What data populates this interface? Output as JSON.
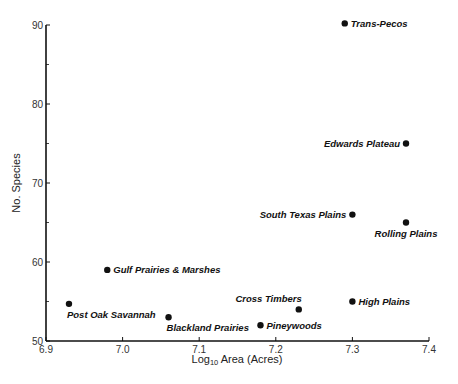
{
  "chart_data": {
    "type": "scatter",
    "title": "",
    "xlabel": "Log10 Area (Acres)",
    "ylabel": "No. Species",
    "xlim": [
      6.9,
      7.4
    ],
    "ylim": [
      50,
      90
    ],
    "x_ticks": [
      "6.9",
      "7.0",
      "7.1",
      "7.2",
      "7.3",
      "7.4"
    ],
    "y_ticks": [
      "50",
      "60",
      "70",
      "80",
      "90"
    ],
    "grid": false,
    "legend": null,
    "points": [
      {
        "label": "Trans-Pecos",
        "x": 7.29,
        "y": 90.2,
        "label_pos": "right"
      },
      {
        "label": "Edwards Plateau",
        "x": 7.37,
        "y": 75,
        "label_pos": "left"
      },
      {
        "label": "South Texas Plains",
        "x": 7.3,
        "y": 66,
        "label_pos": "left"
      },
      {
        "label": "Rolling Plains",
        "x": 7.37,
        "y": 65,
        "label_pos": "below"
      },
      {
        "label": "Gulf Prairies & Marshes",
        "x": 6.98,
        "y": 59,
        "label_pos": "right"
      },
      {
        "label": "Post Oak Savannah",
        "x": 6.93,
        "y": 54.7,
        "label_pos": "below"
      },
      {
        "label": "Cross Timbers",
        "x": 7.23,
        "y": 54,
        "label_pos": "above-left"
      },
      {
        "label": "High Plains",
        "x": 7.3,
        "y": 55,
        "label_pos": "right"
      },
      {
        "label": "Blackland Prairies",
        "x": 7.06,
        "y": 53,
        "label_pos": "below"
      },
      {
        "label": "Pineywoods",
        "x": 7.18,
        "y": 52,
        "label_pos": "right"
      }
    ]
  },
  "axes": {
    "x_title_main": "Log",
    "x_title_sub": "10",
    "x_title_rest": " Area (Acres)",
    "y_title": "No. Species"
  }
}
